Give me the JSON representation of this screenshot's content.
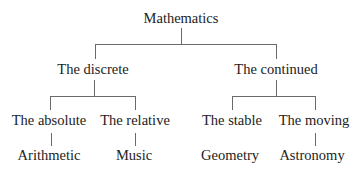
{
  "diagram": {
    "root": "Mathematics",
    "level1": [
      "The discrete",
      "The continued"
    ],
    "level2": [
      "The absolute",
      "The relative",
      "The stable",
      "The moving"
    ],
    "level3": [
      "Arithmetic",
      "Music",
      "Geometry",
      "Astronomy"
    ],
    "edges": [
      [
        "Mathematics",
        "The discrete"
      ],
      [
        "Mathematics",
        "The continued"
      ],
      [
        "The discrete",
        "The absolute"
      ],
      [
        "The discrete",
        "The relative"
      ],
      [
        "The continued",
        "The stable"
      ],
      [
        "The continued",
        "The moving"
      ],
      [
        "The absolute",
        "Arithmetic"
      ],
      [
        "The relative",
        "Music"
      ],
      [
        "The moving",
        "Astronomy"
      ]
    ]
  }
}
